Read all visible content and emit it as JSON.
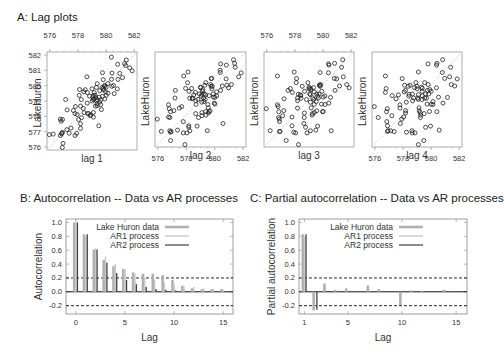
{
  "panels": {
    "a_title": "A: Lag plots",
    "b_title": "B: Autocorrelation -- Data vs AR processes",
    "c_title": "C: Partial autocorrelation -- Data vs AR processes"
  },
  "chart_data": [
    {
      "type": "scatter",
      "title": "A: Lag plots",
      "ylabel": "LakeHuron",
      "panels": [
        "lag 1",
        "lag 2",
        "lag 3",
        "lag 4"
      ],
      "axis_ticks": [
        576,
        578,
        580,
        582
      ],
      "ylim": [
        575.8,
        582.2
      ],
      "xlim": [
        575.8,
        582.2
      ],
      "reference_line": "dotted y = x",
      "series_LakeHuron": [
        580.38,
        581.86,
        580.97,
        580.8,
        579.79,
        580.39,
        580.42,
        580.82,
        581.4,
        581.32,
        581.44,
        581.68,
        581.17,
        580.53,
        580.01,
        579.91,
        579.14,
        579.16,
        579.55,
        579.67,
        578.44,
        578.24,
        579.1,
        579.09,
        579.35,
        578.82,
        579.32,
        579.01,
        579,
        579.8,
        579.83,
        579.72,
        579.89,
        580.01,
        579.37,
        578.69,
        578.19,
        578.67,
        579.55,
        578.92,
        578.09,
        579.37,
        580.13,
        580.14,
        579.51,
        579.24,
        578.66,
        578.86,
        578.05,
        577.79,
        576.75,
        576.75,
        577.82,
        578.64,
        580.58,
        579.48,
        577.38,
        576.9,
        576.94,
        576.24,
        576.84,
        576.85,
        576.9,
        577.79,
        578.18,
        577.51,
        577.23,
        578.42,
        579.61,
        579.05,
        579.26,
        579.22,
        579.38,
        579.1,
        577.95,
        578.12,
        579.75,
        580.85,
        580.41,
        579.96,
        579.61,
        578.76,
        578.18,
        577.21,
        577.13,
        579.1,
        578.25,
        577.91,
        576.89,
        575.96,
        576.8,
        577.68,
        578.38,
        578.52,
        579.74,
        579.31,
        579.89,
        579.96
      ]
    },
    {
      "type": "bar",
      "title": "B: Autocorrelation -- Data vs AR processes",
      "xlabel": "Lag",
      "ylabel": "Autocorrelation",
      "xlim": [
        -1,
        16
      ],
      "ylim": [
        -0.32,
        1.05
      ],
      "x_ticks": [
        0,
        5,
        10,
        15
      ],
      "y_ticks": [
        -0.2,
        0.0,
        0.2,
        0.4,
        0.6,
        0.8,
        1.0
      ],
      "confidence_bounds": [
        0.2,
        -0.2
      ],
      "legend": [
        "Lake Huron data",
        "AR1 process",
        "AR2 process"
      ],
      "legend_position": "top-right",
      "x": [
        0,
        1,
        2,
        3,
        4,
        5,
        6,
        7,
        8,
        9,
        10,
        11,
        12,
        13,
        14,
        15
      ],
      "series": [
        {
          "name": "Lake Huron data",
          "values": [
            1.0,
            0.83,
            0.61,
            0.46,
            0.37,
            0.33,
            0.28,
            0.26,
            0.26,
            0.24,
            0.17,
            0.09,
            0.05,
            0.04,
            0.04,
            0.04
          ]
        },
        {
          "name": "AR1 process",
          "values": [
            1.0,
            0.8,
            0.63,
            0.51,
            0.4,
            0.32,
            0.26,
            0.21,
            0.17,
            0.13,
            0.11,
            0.08,
            0.07,
            0.05,
            0.04,
            0.03
          ]
        },
        {
          "name": "AR2 process",
          "values": [
            1.0,
            0.83,
            0.61,
            0.42,
            0.27,
            0.17,
            0.11,
            0.07,
            0.04,
            0.03,
            0.02,
            0.01,
            0.01,
            0.0,
            0.0,
            0.0
          ]
        }
      ]
    },
    {
      "type": "bar",
      "title": "C: Partial autocorrelation -- Data vs AR processes",
      "xlabel": "Lag",
      "ylabel": "Partial autocorrelation",
      "xlim": [
        0.5,
        16
      ],
      "ylim": [
        -0.32,
        1.05
      ],
      "x_ticks": [
        1,
        5,
        10,
        15
      ],
      "y_ticks": [
        -0.2,
        0.0,
        0.2,
        0.4,
        0.6,
        0.8,
        1.0
      ],
      "confidence_bounds": [
        0.2,
        -0.2
      ],
      "legend": [
        "Lake Huron data",
        "AR1 process",
        "AR2 process"
      ],
      "legend_position": "top-right",
      "x": [
        1,
        2,
        3,
        4,
        5,
        6,
        7,
        8,
        9,
        10,
        11,
        12,
        13,
        14,
        15
      ],
      "series": [
        {
          "name": "Lake Huron data",
          "values": [
            0.83,
            -0.27,
            0.12,
            0.03,
            0.05,
            -0.02,
            0.09,
            0.04,
            0.0,
            -0.19,
            0.02,
            0.01,
            0.0,
            0.03,
            -0.01
          ]
        },
        {
          "name": "AR1 process",
          "values": [
            0.8,
            0.0,
            0.0,
            0.0,
            0.0,
            0.0,
            0.0,
            0.0,
            0.0,
            0.0,
            0.0,
            0.0,
            0.0,
            0.0,
            0.0
          ]
        },
        {
          "name": "AR2 process",
          "values": [
            0.83,
            -0.26,
            0.0,
            0.0,
            0.0,
            0.0,
            0.0,
            0.0,
            0.0,
            0.0,
            0.0,
            0.0,
            0.0,
            0.0,
            0.0
          ]
        }
      ]
    }
  ],
  "colors": {
    "data_bar": "#b0b0b0",
    "ar1_bar": "#c8c8c8",
    "ar2_bar": "#404040",
    "frame": "#888888",
    "refline": "#bdbdbd"
  }
}
